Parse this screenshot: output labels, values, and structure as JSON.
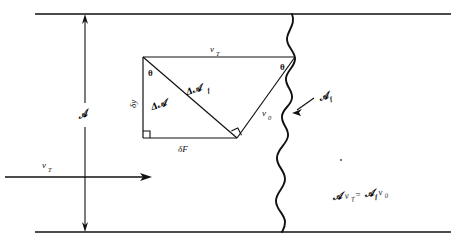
{
  "figure": {
    "type": "physics-flow-diagram",
    "equation": "ℬ vₜ = ℬₑ v₀"
  },
  "labels": {
    "duct_area": "𝒜",
    "duct_velocity_top": "v",
    "duct_velocity_top_sub": "T",
    "inlet_velocity": "v",
    "inlet_velocity_sub": "T",
    "flame_area": "𝒜",
    "flame_area_sub": "f",
    "delta_area": "Δ𝒜",
    "delta_flame_area": "Δ𝒜",
    "delta_flame_area_sub": "f",
    "theta_left": "θ",
    "theta_right": "θ",
    "delta_y": "δy",
    "delta_F": "δF",
    "burning_velocity": "v",
    "burning_velocity_sub": "0",
    "equation_lhs_area": "𝒜",
    "equation_lhs_vel": "v",
    "equation_lhs_vel_sub": "T",
    "equation_eq": "=",
    "equation_rhs_area": "𝒜",
    "equation_rhs_area_sub": "f",
    "equation_rhs_vel": "v",
    "equation_rhs_vel_sub": "0"
  },
  "colors": {
    "ink": "#111111",
    "background": "#ffffff"
  },
  "geometry": {
    "duct_top_y": 14,
    "duct_bottom_y": 232,
    "duct_left_x": 35,
    "duct_right_x": 451,
    "dimension_line_x": 85,
    "triangle_left_x": 143,
    "triangle_top_y": 57,
    "triangle_bottom_y": 138,
    "triangle_right_x": 295,
    "triangle_apex_x": 237,
    "flame_line_x": 290,
    "flow_arrow_y": 177,
    "flow_arrow_start_x": 5,
    "flow_arrow_end_x": 152
  }
}
